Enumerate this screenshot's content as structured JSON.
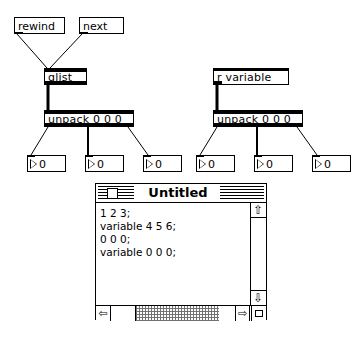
{
  "patch": {
    "messages": [
      {
        "name": "rewind",
        "label": "rewind",
        "x": 14,
        "y": 17,
        "w": 51,
        "h": 17
      },
      {
        "name": "next",
        "label": "next",
        "x": 79,
        "y": 17,
        "w": 45,
        "h": 17
      }
    ],
    "objects": [
      {
        "name": "qlist",
        "label": "qlist",
        "x": 44,
        "y": 68,
        "w": 43,
        "h": 17,
        "thin": false
      },
      {
        "name": "r-variable",
        "label": "r variable",
        "x": 213,
        "y": 68,
        "w": 76,
        "h": 17,
        "thin": true
      },
      {
        "name": "unpack-left",
        "label": "unpack 0 0 0",
        "x": 44,
        "y": 110,
        "w": 90,
        "h": 17,
        "thin": false
      },
      {
        "name": "unpack-right",
        "label": "unpack 0 0 0",
        "x": 213,
        "y": 110,
        "w": 90,
        "h": 17,
        "thin": false
      }
    ],
    "numberboxes": [
      {
        "name": "number-left-1",
        "value": "0",
        "x": 27,
        "y": 155,
        "w": 39,
        "h": 17
      },
      {
        "name": "number-left-2",
        "value": "0",
        "x": 85,
        "y": 155,
        "w": 39,
        "h": 17
      },
      {
        "name": "number-left-3",
        "value": "0",
        "x": 143,
        "y": 155,
        "w": 39,
        "h": 17
      },
      {
        "name": "number-right-1",
        "value": "0",
        "x": 196,
        "y": 155,
        "w": 39,
        "h": 17
      },
      {
        "name": "number-right-2",
        "value": "0",
        "x": 254,
        "y": 155,
        "w": 39,
        "h": 17
      },
      {
        "name": "number-right-3",
        "value": "0",
        "x": 312,
        "y": 155,
        "w": 39,
        "h": 17
      }
    ],
    "cords": [
      {
        "name": "cord-rewind-to-qlist",
        "x1": 17,
        "y1": 34,
        "x2": 47,
        "y2": 68,
        "thick": 1
      },
      {
        "name": "cord-next-to-qlist",
        "x1": 82,
        "y1": 34,
        "x2": 50,
        "y2": 68,
        "thick": 1
      },
      {
        "name": "cord-qlist-to-unpack",
        "x1": 48,
        "y1": 85,
        "x2": 48,
        "y2": 110,
        "thick": 3
      },
      {
        "name": "cord-rvariable-to-unpack",
        "x1": 217,
        "y1": 85,
        "x2": 217,
        "y2": 110,
        "thick": 3
      },
      {
        "name": "cord-unpackL-out1-to-num1",
        "x1": 48,
        "y1": 127,
        "x2": 31,
        "y2": 155,
        "thick": 1
      },
      {
        "name": "cord-unpackL-out2-to-num2",
        "x1": 88,
        "y1": 127,
        "x2": 88,
        "y2": 155,
        "thick": 2
      },
      {
        "name": "cord-unpackL-out3-to-num3",
        "x1": 128,
        "y1": 127,
        "x2": 148,
        "y2": 155,
        "thick": 1
      },
      {
        "name": "cord-unpackR-out1-to-num4",
        "x1": 217,
        "y1": 127,
        "x2": 200,
        "y2": 155,
        "thick": 1
      },
      {
        "name": "cord-unpackR-out2-to-num5",
        "x1": 257,
        "y1": 127,
        "x2": 257,
        "y2": 155,
        "thick": 2
      },
      {
        "name": "cord-unpackR-out3-to-num6",
        "x1": 297,
        "y1": 127,
        "x2": 317,
        "y2": 155,
        "thick": 1
      }
    ]
  },
  "window": {
    "title": "Untitled",
    "close_box": "close-box",
    "text_lines": [
      "1 2 3;",
      "variable 4 5 6;",
      "0 0 0;",
      "variable 0 0 0;"
    ],
    "scroll_up_glyph": "⇧",
    "scroll_down_glyph": "⇩",
    "scroll_left_glyph": "⇦",
    "scroll_right_glyph": "⇨"
  }
}
